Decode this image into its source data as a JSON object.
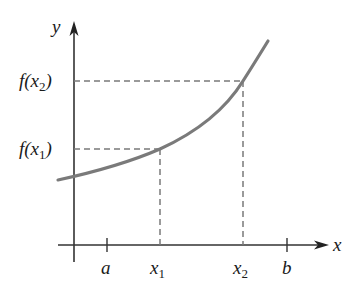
{
  "diagram": {
    "type": "function-graph",
    "axes": {
      "x_label": "x",
      "y_label": "y"
    },
    "x_ticks": [
      {
        "id": "a",
        "text": "a"
      },
      {
        "id": "x1",
        "base": "x",
        "subscript": "1"
      },
      {
        "id": "x2",
        "base": "x",
        "subscript": "2"
      },
      {
        "id": "b",
        "text": "b"
      }
    ],
    "y_labels": [
      {
        "id": "fx2",
        "prefix": "f(x",
        "subscript": "2",
        "suffix": ")"
      },
      {
        "id": "fx1",
        "prefix": "f(x",
        "subscript": "1",
        "suffix": ")"
      }
    ],
    "curve": {
      "color": "#7a7a7a",
      "shape": "increasing, concave up"
    },
    "guide_lines": {
      "style": "dashed",
      "color": "#7a7a7a"
    },
    "axis_color": "#333333"
  }
}
